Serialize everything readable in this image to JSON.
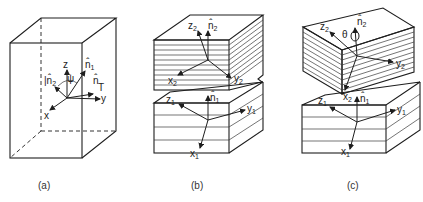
{
  "panels": [
    {
      "id": "a",
      "caption": "(a)",
      "labels": {
        "z": "z",
        "y": "y",
        "x": "x",
        "n1": "n̂",
        "n1_sub": "1",
        "n2": "n̂",
        "n2_sub": "2",
        "n": "n̂",
        "T": "T",
        "psi": "ψ"
      }
    },
    {
      "id": "b",
      "caption": "(b)",
      "labels": {
        "z2": "z",
        "z2_sub": "2",
        "n2": "n̂",
        "n2_sub": "2",
        "x2": "x",
        "x2_sub": "2",
        "y2": "y",
        "y2_sub": "2",
        "z1": "z",
        "z1_sub": "1",
        "n1": "n̂",
        "n1_sub": "1",
        "y1": "y",
        "y1_sub": "1",
        "x1": "x",
        "x1_sub": "1"
      }
    },
    {
      "id": "c",
      "caption": "(c)",
      "labels": {
        "z2": "z",
        "z2_sub": "2",
        "theta": "θ",
        "n2": "n̂",
        "n2_sub": "2",
        "y2": "y",
        "y2_sub": "2",
        "x2": "x",
        "x2_sub": "2",
        "z1": "z",
        "z1_sub": "1",
        "n1": "n̂",
        "n1_sub": "1",
        "y1": "y",
        "y1_sub": "1",
        "x1": "x",
        "x1_sub": "1"
      }
    }
  ],
  "colors": {
    "line": "#1e1e1e",
    "background": "#ffffff"
  }
}
